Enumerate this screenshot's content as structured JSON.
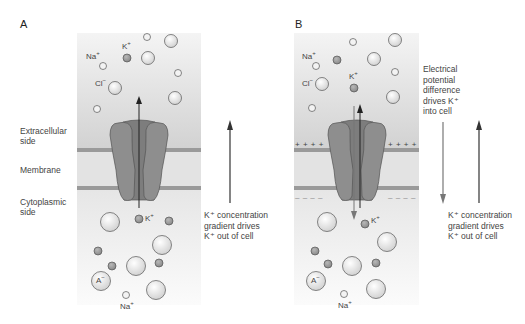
{
  "figure": {
    "panel_a": {
      "letter": "A",
      "labels": {
        "na_top": "Na",
        "na_top_sup": "+",
        "k_top": "K",
        "k_top_sup": "+",
        "cl_top": "Cl",
        "cl_top_sup": "−",
        "k_bottom": "K",
        "k_bottom_sup": "+",
        "a_bottom": "A",
        "a_bottom_sup": "−",
        "na_bottom": "Na",
        "na_bottom_sup": "+"
      },
      "arrow_note": [
        "K⁺ concentration",
        "gradient drives",
        "K⁺ out of cell"
      ]
    },
    "panel_b": {
      "letter": "B",
      "labels": {
        "na_top": "Na",
        "na_top_sup": "+",
        "k_top": "K",
        "k_top_sup": "+",
        "cl_top": "Cl",
        "cl_top_sup": "−",
        "k_bottom": "K",
        "k_bottom_sup": "+",
        "a_bottom": "A",
        "a_bottom_sup": "−",
        "na_bottom": "Na",
        "na_bottom_sup": "+"
      },
      "charges_top": "+ + + +",
      "charges_bottom": "– – – –",
      "electrical_note": [
        "Electrical",
        "potential",
        "difference",
        "drives K⁺",
        "into cell"
      ],
      "arrow_note": [
        "K⁺ concentration",
        "gradient drives",
        "K⁺ out of cell"
      ]
    },
    "side_labels": {
      "extracellular": [
        "Extracellular",
        "side"
      ],
      "membrane": "Membrane",
      "cytoplasmic": [
        "Cytoplasmic",
        "side"
      ]
    },
    "colors": {
      "extracellular_bg": "#d6d6d6",
      "cytoplasm_bg": "#ececec",
      "membrane_band": "#9a9a9a",
      "channel": "#8c8c8c",
      "channel_dark": "#7a7a7a",
      "k_ion": "#9b9b9b",
      "arrow": "#333333",
      "arrow_light": "#777777"
    }
  }
}
